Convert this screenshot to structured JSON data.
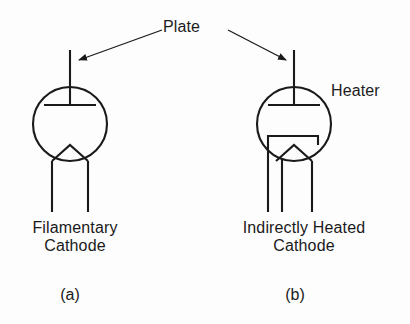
{
  "figure": {
    "background_color": "#fdfdfd",
    "stroke_color": "#1a1a1a",
    "text_color": "#1c1c1c"
  },
  "annotations": {
    "plate_label": "Plate",
    "heater_label": "Heater"
  },
  "symbols": [
    {
      "id": "filamentary-cathode",
      "caption_line1": "Filamentary",
      "caption_line2": "Cathode",
      "sublabel": "(a)",
      "envelope": {
        "cx": 70,
        "cy": 124,
        "r": 37
      },
      "plate_lead_top_y": 50,
      "plate_bar_y": 105,
      "plate_bar_half_width": 26,
      "lead_count": 2,
      "lead_bottom_y": 212,
      "has_heater_sleeve": false
    },
    {
      "id": "indirectly-heated-cathode",
      "caption_line1": "Indirectly Heated",
      "caption_line2": "Cathode",
      "sublabel": "(b)",
      "envelope": {
        "cx": 294,
        "cy": 124,
        "r": 37
      },
      "plate_lead_top_y": 50,
      "plate_bar_y": 105,
      "plate_bar_half_width": 26,
      "lead_count": 3,
      "lead_bottom_y": 212,
      "has_heater_sleeve": true
    }
  ],
  "pointer_lines": [
    {
      "id": "plate-arrow-left",
      "from_x": 162,
      "from_y": 30,
      "to_x": 76,
      "to_y": 61
    },
    {
      "id": "plate-arrow-right",
      "from_x": 228,
      "from_y": 30,
      "to_x": 289,
      "to_y": 61
    }
  ]
}
